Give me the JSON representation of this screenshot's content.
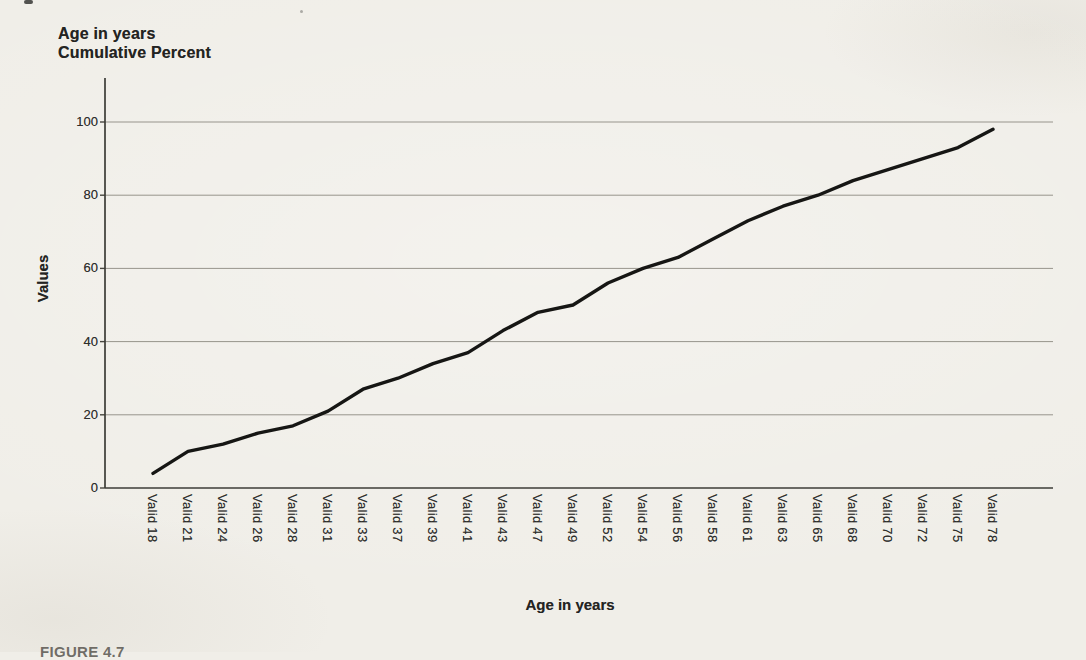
{
  "page": {
    "background": "#f0eee8",
    "caption_fragment": "FIGURE 4.7"
  },
  "chart": {
    "title_line1": "Age in years",
    "title_line2": "Cumulative Percent",
    "y_axis_title": "Values",
    "x_axis_title": "Age in years"
  },
  "chart_data": {
    "type": "line",
    "xlabel": "Age in years",
    "ylabel": "Values",
    "ylim": [
      0,
      100
    ],
    "y_ticks": [
      0,
      20,
      40,
      60,
      80,
      100
    ],
    "grid": true,
    "legend_position": "none",
    "line_color": "#161614",
    "categories": [
      "Valid 18",
      "Valid 21",
      "Valid 24",
      "Valid 26",
      "Valid 28",
      "Valid 31",
      "Valid 33",
      "Valid 37",
      "Valid 39",
      "Valid 41",
      "Valid 43",
      "Valid 47",
      "Valid 49",
      "Valid 52",
      "Valid 54",
      "Valid 56",
      "Valid 58",
      "Valid 61",
      "Valid 63",
      "Valid 65",
      "Valid 68",
      "Valid 70",
      "Valid 72",
      "Valid 75",
      "Valid 78"
    ],
    "values": [
      4,
      10,
      12,
      15,
      17,
      21,
      27,
      30,
      34,
      37,
      43,
      48,
      50,
      56,
      60,
      63,
      68,
      73,
      77,
      80,
      84,
      87,
      90,
      93,
      98
    ]
  }
}
